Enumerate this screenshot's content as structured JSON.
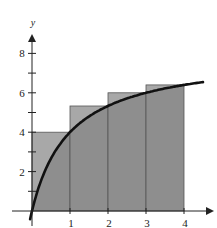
{
  "chart_data": {
    "type": "bar",
    "subtype": "upper-riemann-sum-with-curve",
    "title": "",
    "xlabel": "",
    "ylabel": "y",
    "function": "f(x) = 8x/(x+1)",
    "categories": [
      "[0,1]",
      "[1,2]",
      "[2,3]",
      "[3,4]"
    ],
    "rectangles": [
      {
        "x0": 0,
        "x1": 1,
        "height": 4
      },
      {
        "x0": 1,
        "x1": 2,
        "height": 5.33
      },
      {
        "x0": 2,
        "x1": 3,
        "height": 6
      },
      {
        "x0": 3,
        "x1": 4,
        "height": 6.4
      }
    ],
    "values": [
      4,
      5.33,
      6,
      6.4
    ],
    "curve": {
      "x_range": [
        -0.05,
        4.5
      ]
    },
    "x_ticks": [
      1,
      2,
      3,
      4
    ],
    "x_tick_labels": [
      "1",
      "2",
      "3",
      "4"
    ],
    "y_ticks": [
      1,
      2,
      3,
      4,
      5,
      6,
      7,
      8
    ],
    "y_tick_labels": {
      "2": "2",
      "4": "4",
      "6": "6",
      "8": "8"
    },
    "xlim": [
      0,
      4.7
    ],
    "ylim": [
      0,
      9
    ],
    "grid": false,
    "legend": null,
    "colors": {
      "rect_fill_above_curve": "#a8a8a8",
      "rect_fill_below_curve": "#8e8e8e",
      "rect_stroke": "#555555",
      "curve": "#111111",
      "axis": "#222222"
    }
  }
}
